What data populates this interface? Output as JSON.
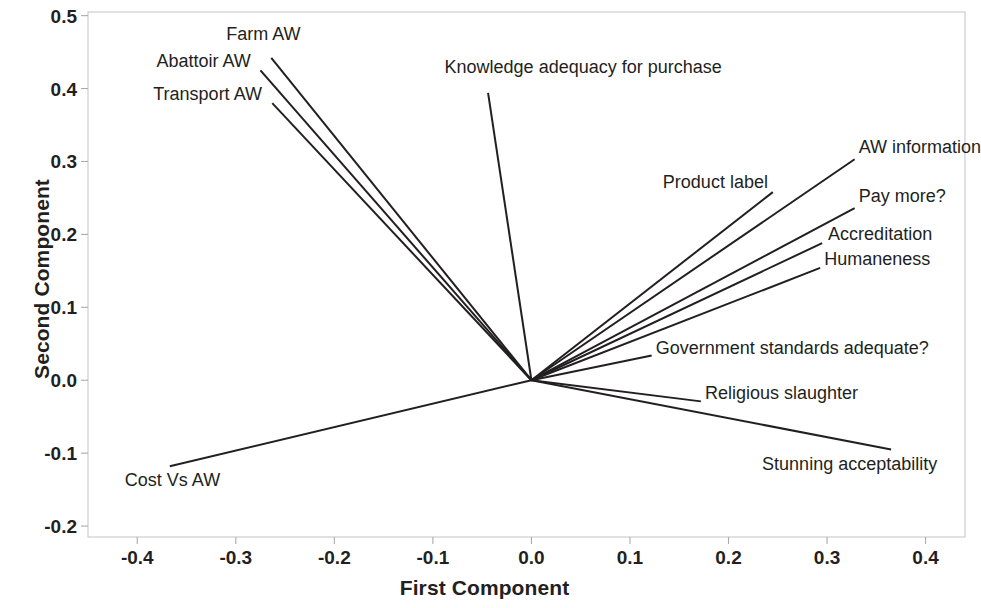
{
  "chart_data": {
    "type": "scatter",
    "subtype": "pca-loading-plot",
    "title": "",
    "xlabel": "First Component",
    "ylabel": "Second Component",
    "xlim": [
      -0.45,
      0.44
    ],
    "ylim": [
      -0.215,
      0.505
    ],
    "xticks": [
      "-0.4",
      "-0.3",
      "-0.2",
      "-0.1",
      "0.0",
      "0.1",
      "0.2",
      "0.3",
      "0.4"
    ],
    "xtick_values": [
      -0.4,
      -0.3,
      -0.2,
      -0.1,
      0.0,
      0.1,
      0.2,
      0.3,
      0.4
    ],
    "yticks": [
      "0.5",
      "0.4",
      "0.3",
      "0.2",
      "0.1",
      "0.0",
      "-0.1",
      "-0.2"
    ],
    "ytick_values": [
      0.5,
      0.4,
      0.3,
      0.2,
      0.1,
      0.0,
      -0.1,
      -0.2
    ],
    "grid": false,
    "legend": false,
    "origin": [
      0.0,
      0.0
    ],
    "line_color": "#231f20",
    "frame_color": "#c9c9c9",
    "variables": [
      {
        "label": "Farm AW",
        "x": -0.264,
        "y": 0.442,
        "label_anchor": "mid",
        "label_dx": -8,
        "label_dy": -24
      },
      {
        "label": "Abattoir AW",
        "x": -0.275,
        "y": 0.425,
        "label_anchor": "end",
        "label_dx": -10,
        "label_dy": -9
      },
      {
        "label": "Transport AW",
        "x": -0.263,
        "y": 0.38,
        "label_anchor": "end",
        "label_dx": -10,
        "label_dy": -9
      },
      {
        "label": "Knowledge adequacy for purchase",
        "x": -0.044,
        "y": 0.394,
        "label_anchor": "mid",
        "label_dx": 95,
        "label_dy": -26
      },
      {
        "label": "AW information",
        "x": 0.328,
        "y": 0.303,
        "label_anchor": "start",
        "label_dx": 4,
        "label_dy": -12
      },
      {
        "label": "Product label",
        "x": 0.245,
        "y": 0.258,
        "label_anchor": "end",
        "label_dx": -5,
        "label_dy": -10
      },
      {
        "label": "Pay more?",
        "x": 0.328,
        "y": 0.236,
        "label_anchor": "start",
        "label_dx": 4,
        "label_dy": -12
      },
      {
        "label": "Accreditation",
        "x": 0.295,
        "y": 0.188,
        "label_anchor": "start",
        "label_dx": 6,
        "label_dy": -9
      },
      {
        "label": "Humaneness",
        "x": 0.293,
        "y": 0.154,
        "label_anchor": "start",
        "label_dx": 4,
        "label_dy": -9
      },
      {
        "label": "Government standards adequate?",
        "x": 0.122,
        "y": 0.034,
        "label_anchor": "start",
        "label_dx": 4,
        "label_dy": -7
      },
      {
        "label": "Religious slaughter",
        "x": 0.172,
        "y": -0.029,
        "label_anchor": "start",
        "label_dx": 4,
        "label_dy": -8
      },
      {
        "label": "Stunning acceptability",
        "x": 0.365,
        "y": -0.095,
        "label_anchor": "end",
        "label_dx": 46,
        "label_dy": 14
      },
      {
        "label": "Cost Vs AW",
        "x": -0.367,
        "y": -0.118,
        "label_anchor": "start",
        "label_dx": -45,
        "label_dy": 14
      }
    ]
  },
  "plot": {
    "x_axis_title": "First Component",
    "y_axis_title": "Second Component"
  }
}
